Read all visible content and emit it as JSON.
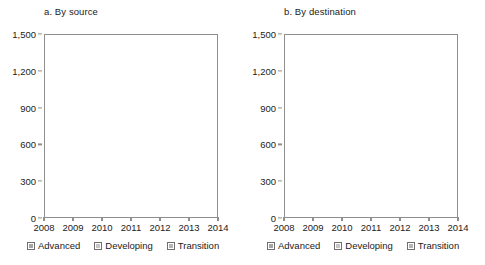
{
  "figure": {
    "width": 485,
    "height": 265
  },
  "legend": {
    "items": [
      {
        "label": "Advanced",
        "color": "#a5a5a5",
        "key": "advanced"
      },
      {
        "label": "Developing",
        "color": "#c6c6c6",
        "key": "developing"
      },
      {
        "label": "Transition",
        "color": "#b4b4b4",
        "key": "transition"
      }
    ]
  },
  "chart_data": [
    {
      "type": "area",
      "stacked": true,
      "title": "a. By source",
      "xlabel": "",
      "ylabel": "",
      "x": [
        "2008",
        "2009",
        "2010",
        "2011",
        "2012",
        "2013",
        "2014"
      ],
      "categories": [
        "2008",
        "2009",
        "2010",
        "2011",
        "2012",
        "2013",
        "2014"
      ],
      "series": [
        {
          "name": "Advanced",
          "color": "#a5a5a5",
          "values": [
            1000,
            760,
            640,
            610,
            450,
            470,
            490
          ]
        },
        {
          "name": "Developing",
          "color": "#c6c6c6",
          "values": [
            440,
            280,
            220,
            280,
            185,
            215,
            180
          ]
        },
        {
          "name": "Transition",
          "color": "#b4b4b4",
          "values": [
            30,
            20,
            10,
            10,
            10,
            10,
            10
          ]
        }
      ],
      "totals": [
        1470,
        1060,
        870,
        900,
        645,
        695,
        680
      ],
      "ylim": [
        0,
        1500
      ],
      "yticks": [
        0,
        300,
        600,
        900,
        1200,
        1500
      ],
      "ytick_labels": [
        "0",
        "300",
        "600",
        "900",
        "1,200",
        "1,500"
      ],
      "gridlines": [
        900,
        1200
      ],
      "grid": "dashed-horizontal-at-900-and-1200",
      "legend_position": "bottom"
    },
    {
      "type": "area",
      "stacked": true,
      "title": "b. By destination",
      "xlabel": "",
      "ylabel": "",
      "x": [
        "2008",
        "2009",
        "2010",
        "2011",
        "2012",
        "2013",
        "2014"
      ],
      "categories": [
        "2008",
        "2009",
        "2010",
        "2011",
        "2012",
        "2013",
        "2014"
      ],
      "series": [
        {
          "name": "Advanced",
          "color": "#a5a5a5",
          "values": [
            425,
            330,
            300,
            290,
            255,
            230,
            210
          ]
        },
        {
          "name": "Developing",
          "color": "#c6c6c6",
          "values": [
            1000,
            690,
            525,
            580,
            370,
            450,
            455
          ]
        },
        {
          "name": "Transition",
          "color": "#b4b4b4",
          "values": [
            45,
            40,
            45,
            30,
            20,
            15,
            15
          ]
        }
      ],
      "totals": [
        1470,
        1060,
        870,
        900,
        645,
        695,
        680
      ],
      "ylim": [
        0,
        1500
      ],
      "yticks": [
        0,
        300,
        600,
        900,
        1200,
        1500
      ],
      "ytick_labels": [
        "0",
        "300",
        "600",
        "900",
        "1,200",
        "1,500"
      ],
      "gridlines": [
        900,
        1200
      ],
      "grid": "dashed-horizontal-at-900-and-1200",
      "legend_position": "bottom"
    }
  ]
}
